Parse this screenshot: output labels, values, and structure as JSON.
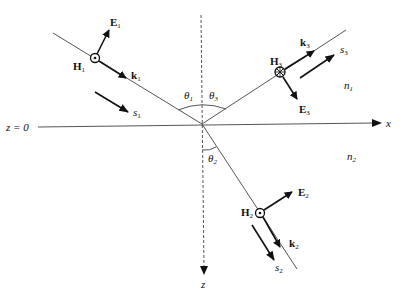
{
  "diagram": {
    "interface_label": "z = 0",
    "axes": {
      "x": "x",
      "z": "z"
    },
    "media": {
      "upper": "n",
      "upper_sub": "1",
      "lower": "n",
      "lower_sub": "2"
    },
    "angles": [
      {
        "sym": "θ",
        "sub": "1"
      },
      {
        "sym": "θ",
        "sub": "3"
      },
      {
        "sym": "θ",
        "sub": "2"
      }
    ],
    "incident": {
      "E": "E",
      "H": "H",
      "k": "k",
      "s": "s",
      "sub": "1"
    },
    "reflected": {
      "E": "E",
      "H": "H",
      "k": "k",
      "s": "s",
      "sub": "3"
    },
    "transmitted": {
      "E": "E",
      "H": "H",
      "k": "k",
      "s": "s",
      "sub": "2"
    },
    "colors": {
      "ink": "#111111",
      "line": "#555555"
    }
  }
}
